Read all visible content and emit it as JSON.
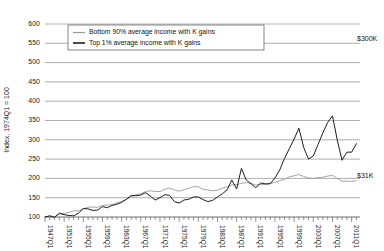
{
  "chart_data": {
    "type": "line",
    "title": "",
    "xlabel": "",
    "ylabel": "Index, 1974Q1 = 100",
    "ylim": [
      100,
      600
    ],
    "ytick_values": [
      100,
      150,
      200,
      250,
      300,
      350,
      400,
      450,
      500,
      550,
      600
    ],
    "ytick_labels": [
      "100",
      "150",
      "200",
      "250",
      "300",
      "350",
      "400",
      "450",
      "500",
      "550",
      "600"
    ],
    "xlim": [
      1947,
      2012.75
    ],
    "xtick_labels": [
      "1947Q1",
      "1951Q1",
      "1955Q1",
      "1959Q1",
      "1963Q1",
      "1967Q1",
      "1971Q1",
      "1975Q1",
      "1979Q1",
      "1983Q1",
      "1987Q1",
      "1991Q1",
      "1995Q1",
      "1999Q1",
      "2003Q1",
      "2007Q1",
      "2011Q1"
    ],
    "xtick_values": [
      1947,
      1951,
      1955,
      1959,
      1963,
      1967,
      1971,
      1975,
      1979,
      1983,
      1987,
      1991,
      1995,
      1999,
      2003,
      2007,
      2011
    ],
    "minor_tick_interval_years": 1,
    "grid": "horizontal",
    "legend_position": "top-center",
    "colors": {
      "bottom90": "#9a9a9a",
      "top1": "#111111",
      "grid": "#8c8c8c"
    },
    "annotations": [
      {
        "name": "top1-end-value",
        "text": "$300K",
        "x": 2011.5,
        "y": 560
      },
      {
        "name": "bottom90-end-value",
        "text": "$31K",
        "x": 2011.5,
        "y": 205
      }
    ],
    "series": [
      {
        "name": "Bottom 90% average income with K gains",
        "color": "#9a9a9a",
        "points": [
          [
            1947,
            100
          ],
          [
            1948,
            102
          ],
          [
            1949,
            101
          ],
          [
            1950,
            107
          ],
          [
            1951,
            109
          ],
          [
            1952,
            112
          ],
          [
            1953,
            116
          ],
          [
            1954,
            116
          ],
          [
            1955,
            121
          ],
          [
            1956,
            125
          ],
          [
            1957,
            126
          ],
          [
            1958,
            125
          ],
          [
            1959,
            130
          ],
          [
            1960,
            131
          ],
          [
            1961,
            132
          ],
          [
            1962,
            137
          ],
          [
            1963,
            140
          ],
          [
            1964,
            146
          ],
          [
            1965,
            152
          ],
          [
            1966,
            158
          ],
          [
            1967,
            160
          ],
          [
            1968,
            166
          ],
          [
            1969,
            168
          ],
          [
            1970,
            166
          ],
          [
            1971,
            166
          ],
          [
            1972,
            172
          ],
          [
            1973,
            175
          ],
          [
            1974,
            170
          ],
          [
            1975,
            167
          ],
          [
            1976,
            171
          ],
          [
            1977,
            174
          ],
          [
            1978,
            179
          ],
          [
            1979,
            178
          ],
          [
            1980,
            172
          ],
          [
            1981,
            170
          ],
          [
            1982,
            168
          ],
          [
            1983,
            169
          ],
          [
            1984,
            175
          ],
          [
            1985,
            178
          ],
          [
            1986,
            183
          ],
          [
            1987,
            184
          ],
          [
            1988,
            187
          ],
          [
            1989,
            189
          ],
          [
            1990,
            187
          ],
          [
            1991,
            183
          ],
          [
            1992,
            184
          ],
          [
            1993,
            184
          ],
          [
            1994,
            187
          ],
          [
            1995,
            190
          ],
          [
            1996,
            194
          ],
          [
            1997,
            198
          ],
          [
            1998,
            204
          ],
          [
            1999,
            207
          ],
          [
            2000,
            210
          ],
          [
            2001,
            205
          ],
          [
            2002,
            201
          ],
          [
            2003,
            200
          ],
          [
            2004,
            202
          ],
          [
            2005,
            203
          ],
          [
            2006,
            206
          ],
          [
            2007,
            208
          ],
          [
            2008,
            200
          ],
          [
            2009,
            193
          ],
          [
            2010,
            193
          ],
          [
            2011,
            192
          ],
          [
            2012,
            194
          ]
        ]
      },
      {
        "name": "Top 1% average income with K gains",
        "color": "#111111",
        "points": [
          [
            1947,
            100
          ],
          [
            1948,
            103
          ],
          [
            1949,
            99
          ],
          [
            1950,
            110
          ],
          [
            1951,
            106
          ],
          [
            1952,
            104
          ],
          [
            1953,
            103
          ],
          [
            1954,
            110
          ],
          [
            1955,
            122
          ],
          [
            1956,
            121
          ],
          [
            1957,
            117
          ],
          [
            1958,
            118
          ],
          [
            1959,
            127
          ],
          [
            1960,
            124
          ],
          [
            1961,
            130
          ],
          [
            1962,
            133
          ],
          [
            1963,
            138
          ],
          [
            1964,
            146
          ],
          [
            1965,
            156
          ],
          [
            1966,
            155
          ],
          [
            1967,
            157
          ],
          [
            1968,
            163
          ],
          [
            1969,
            154
          ],
          [
            1970,
            144
          ],
          [
            1971,
            150
          ],
          [
            1972,
            158
          ],
          [
            1973,
            156
          ],
          [
            1974,
            140
          ],
          [
            1975,
            136
          ],
          [
            1976,
            144
          ],
          [
            1977,
            146
          ],
          [
            1978,
            152
          ],
          [
            1979,
            152
          ],
          [
            1980,
            145
          ],
          [
            1981,
            140
          ],
          [
            1982,
            143
          ],
          [
            1983,
            152
          ],
          [
            1984,
            160
          ],
          [
            1985,
            170
          ],
          [
            1986,
            196
          ],
          [
            1987,
            173
          ],
          [
            1988,
            226
          ],
          [
            1989,
            196
          ],
          [
            1990,
            186
          ],
          [
            1991,
            176
          ],
          [
            1992,
            188
          ],
          [
            1993,
            186
          ],
          [
            1994,
            186
          ],
          [
            1995,
            201
          ],
          [
            1996,
            222
          ],
          [
            1997,
            252
          ],
          [
            1998,
            277
          ],
          [
            1999,
            302
          ],
          [
            2000,
            330
          ],
          [
            2001,
            280
          ],
          [
            2002,
            250
          ],
          [
            2003,
            258
          ],
          [
            2004,
            288
          ],
          [
            2005,
            318
          ],
          [
            2006,
            345
          ],
          [
            2007,
            362
          ],
          [
            2008,
            300
          ],
          [
            2009,
            247
          ],
          [
            2010,
            268
          ],
          [
            2011,
            268
          ],
          [
            2012,
            290
          ]
        ]
      }
    ],
    "note_on_shape": "Top 1% series shows sharp capital-gains spikes near 1986 and 1988, a steep climb through the late 1990s peaking near 2000, a dip to 2002, a second higher peak near 2007, a sharp crash in 2009 and partial recovery by 2011."
  },
  "legend": {
    "items": [
      {
        "label": "Bottom 90% average income with K gains",
        "style": "thin-gray"
      },
      {
        "label": "Top 1% average income with K gains",
        "style": "thick-black"
      }
    ]
  }
}
